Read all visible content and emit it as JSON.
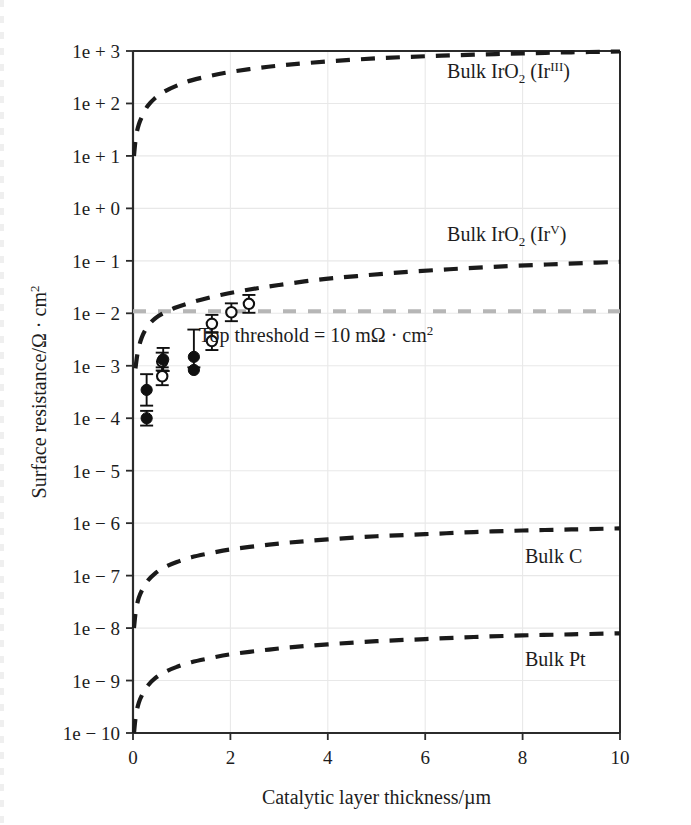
{
  "chart_data": {
    "type": "line",
    "title": "",
    "xlabel": "Catalytic layer thickness/µm",
    "ylabel": "Surface resistance/Ω · cm",
    "ylabel_sup": "2",
    "xlim": [
      0,
      10
    ],
    "ylim_log10": [
      -10,
      3
    ],
    "yscale": "log",
    "grid": true,
    "legend_position": "inline-right",
    "xticks": [
      0,
      2,
      4,
      6,
      8,
      10
    ],
    "xtick_labels": [
      "0",
      "2",
      "4",
      "6",
      "8",
      "10"
    ],
    "yticks_log10": [
      3,
      2,
      1,
      0,
      -1,
      -2,
      -3,
      -4,
      -5,
      -6,
      -7,
      -8,
      -9,
      -10
    ],
    "ytick_labels": [
      "1e + 3",
      "1e + 2",
      "1e + 1",
      "1e + 0",
      "1e − 1",
      "1e − 2",
      "1e − 3",
      "1e − 4",
      "1e − 5",
      "1e − 6",
      "1e − 7",
      "1e − 8",
      "1e − 9",
      "1e − 10"
    ],
    "series": [
      {
        "name": "Bulk IrO2 (IrIII)",
        "label_text": "Bulk IrO",
        "label_sub": "2",
        "label_tail_open": " (Ir",
        "label_sup": "III",
        "label_tail_close": ")",
        "style": "dashed",
        "color": "#1a1a1a",
        "label_x": 6.45,
        "label_y_log10": 2.48,
        "x": [
          0.02,
          0.06,
          0.12,
          0.2,
          0.3,
          0.45,
          0.65,
          0.9,
          1.2,
          1.6,
          2.0,
          2.6,
          3.2,
          4.0,
          5.0,
          6.0,
          7.0,
          8.0,
          9.0,
          10.0
        ],
        "y_log10": [
          1.0,
          1.36,
          1.6,
          1.78,
          1.95,
          2.1,
          2.23,
          2.34,
          2.44,
          2.53,
          2.6,
          2.68,
          2.74,
          2.8,
          2.86,
          2.9,
          2.93,
          2.955,
          2.975,
          2.99
        ]
      },
      {
        "name": "Bulk IrO2 (IrV)",
        "label_text": "Bulk IrO",
        "label_sub": "2",
        "label_tail_open": " (Ir",
        "label_sup": "V",
        "label_tail_close": ")",
        "style": "dashed",
        "color": "#1a1a1a",
        "label_x": 6.45,
        "label_y_log10": -0.62,
        "x": [
          0.05,
          0.1,
          0.18,
          0.3,
          0.45,
          0.62,
          0.85,
          1.1,
          1.4,
          1.8,
          2.3,
          3.0,
          3.8,
          4.6,
          5.5,
          6.5,
          7.5,
          8.5,
          9.3,
          10.0
        ],
        "y_log10": [
          -3.05,
          -2.73,
          -2.46,
          -2.25,
          -2.1,
          -2.0,
          -1.9,
          -1.82,
          -1.74,
          -1.65,
          -1.56,
          -1.46,
          -1.36,
          -1.29,
          -1.22,
          -1.16,
          -1.11,
          -1.07,
          -1.04,
          -1.02
        ]
      },
      {
        "name": "Bulk C",
        "label_text": "Bulk C",
        "style": "dashed",
        "color": "#1a1a1a",
        "label_x": 8.05,
        "label_y_log10": -6.75,
        "x": [
          0.02,
          0.06,
          0.12,
          0.2,
          0.3,
          0.45,
          0.65,
          0.9,
          1.2,
          1.6,
          2.0,
          2.6,
          3.2,
          4.0,
          5.0,
          6.0,
          7.0,
          8.0,
          9.0,
          10.0
        ],
        "y_log10": [
          -8.0,
          -7.66,
          -7.42,
          -7.25,
          -7.1,
          -6.96,
          -6.84,
          -6.74,
          -6.65,
          -6.57,
          -6.5,
          -6.43,
          -6.37,
          -6.31,
          -6.25,
          -6.21,
          -6.17,
          -6.14,
          -6.12,
          -6.1
        ]
      },
      {
        "name": "Bulk Pt",
        "label_text": "Bulk Pt",
        "style": "dashed",
        "color": "#1a1a1a",
        "label_x": 8.05,
        "label_y_log10": -8.72,
        "x": [
          0.02,
          0.06,
          0.12,
          0.2,
          0.3,
          0.45,
          0.65,
          0.9,
          1.2,
          1.6,
          2.0,
          2.6,
          3.2,
          4.0,
          5.0,
          6.0,
          7.0,
          8.0,
          9.0,
          10.0
        ],
        "y_log10": [
          -10.0,
          -9.66,
          -9.42,
          -9.25,
          -9.1,
          -8.96,
          -8.84,
          -8.74,
          -8.65,
          -8.57,
          -8.5,
          -8.43,
          -8.37,
          -8.31,
          -8.25,
          -8.21,
          -8.17,
          -8.14,
          -8.12,
          -8.1
        ]
      }
    ],
    "threshold": {
      "label": "Top threshold = 10 mΩ · cm",
      "label_sup": "2",
      "value_log10": -1.96,
      "color": "#b6b6b6",
      "style": "dashed",
      "label_x": 1.35,
      "label_y_log10": -2.55
    },
    "points_filled": {
      "name": "Measured (filled circles)",
      "marker": "filled-circle",
      "color": "#101010",
      "x": [
        0.28,
        0.28,
        0.62,
        1.25,
        1.25
      ],
      "y_log10": [
        -4.0,
        -3.46,
        -2.88,
        -2.83,
        -3.08
      ],
      "err_up": [
        0.14,
        0.3,
        0.22,
        0.52,
        0.0
      ],
      "err_dn": [
        0.14,
        0.3,
        0.22,
        0.2,
        0.0
      ]
    },
    "points_open": {
      "name": "Measured (open circles)",
      "marker": "open-circle",
      "color": "#101010",
      "x": [
        0.6,
        0.6,
        1.62,
        1.62,
        2.02,
        2.38
      ],
      "y_log10": [
        -3.2,
        -2.92,
        -2.53,
        -2.2,
        -1.98,
        -1.82
      ],
      "err_up": [
        0.17,
        0.17,
        0.17,
        0.17,
        0.17,
        0.17
      ],
      "err_dn": [
        0.17,
        0.17,
        0.17,
        0.17,
        0.17,
        0.17
      ]
    }
  }
}
